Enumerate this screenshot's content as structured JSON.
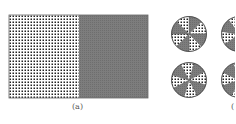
{
  "panel_a": {
    "caption": "(a)",
    "left_pattern": "dotted",
    "right_fill": "#7d7d7d"
  },
  "panel_b": {
    "caption": "(",
    "pie_count_visible": 4,
    "sectors_per_pie": 8,
    "sector_patterns": [
      "gray",
      "dotted",
      "gray",
      "dotted",
      "gray",
      "dotted",
      "gray",
      "dotted"
    ]
  },
  "colors": {
    "gray": "#7d7d7d",
    "dot": "#222222",
    "border": "#666666"
  }
}
